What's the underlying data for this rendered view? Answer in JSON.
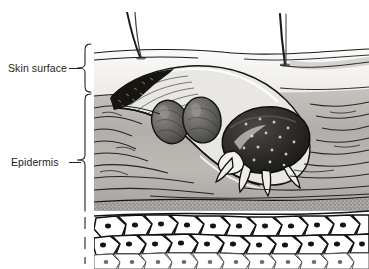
{
  "figure": {
    "width": 369,
    "height": 269,
    "background_color": "#ffffff"
  },
  "labels": [
    {
      "id": "skin-surface",
      "text": "Skin surface",
      "marker": "curly-brace",
      "points_to": "stratum corneum / outermost skin layer"
    },
    {
      "id": "epidermis",
      "text": "Epidermis",
      "marker": "curly-brace",
      "points_to": "epidermal layers below the skin surface"
    }
  ],
  "illustration": {
    "style": "black-and-white engraved medical line drawing",
    "layers": [
      {
        "name": "stratum-corneum",
        "fill": "#f2f0ee"
      },
      {
        "name": "keratin-layer",
        "fill": "#b9b6b2"
      },
      {
        "name": "granular-layer",
        "fill": "#a9a6a2"
      },
      {
        "name": "cellular-layer",
        "fill": "#ffffff"
      }
    ],
    "features": [
      {
        "name": "hair-shaft",
        "count": 3
      },
      {
        "name": "burrow-tunnel",
        "count": 1
      },
      {
        "name": "mite",
        "count": 1
      },
      {
        "name": "mite-eggs",
        "count": 2
      },
      {
        "name": "keratinocyte-cells",
        "count": 34
      }
    ],
    "line_color": "#141414"
  }
}
